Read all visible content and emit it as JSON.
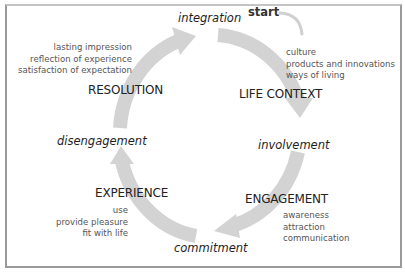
{
  "diagram": {
    "start_label": "start",
    "phases": {
      "integration": "integration",
      "involvement": "involvement",
      "commitment": "commitment",
      "disengagement": "disengagement"
    },
    "stages": [
      {
        "id": "life_context",
        "title": "LIFE CONTEXT",
        "items": [
          "culture",
          "products and innovations",
          "ways of living"
        ]
      },
      {
        "id": "engagement",
        "title": "ENGAGEMENT",
        "items": [
          "awareness",
          "attraction",
          "communication"
        ]
      },
      {
        "id": "experience",
        "title": "EXPERIENCE",
        "items": [
          "use",
          "provide pleasure",
          "fit with life"
        ]
      },
      {
        "id": "resolution",
        "title": "RESOLUTION",
        "items": [
          "lasting impression",
          "reflection of experience",
          "satisfaction of expectation"
        ]
      }
    ],
    "colors": {
      "arrow": "#d3d3d3",
      "frame": "#9a9a9a",
      "text": "#222222",
      "subtext": "#555555"
    }
  }
}
